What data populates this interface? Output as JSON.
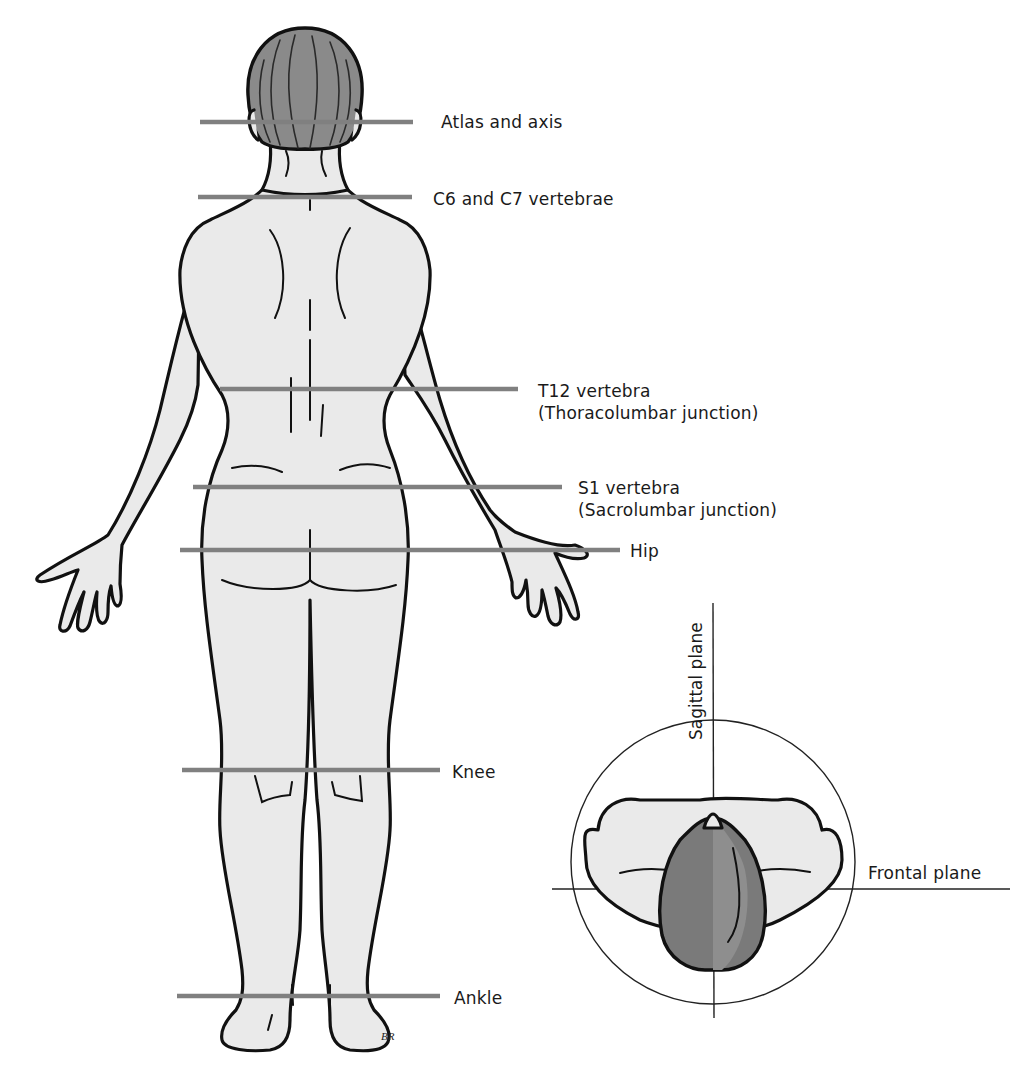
{
  "diagram": {
    "type": "anatomical-illustration",
    "colors": {
      "background": "#ffffff",
      "outline": "#111111",
      "skin": "#eaeaea",
      "hair": "#8a8a8a",
      "reference_line": "#808080",
      "plane_line": "#222222"
    },
    "reference_levels": [
      {
        "id": "atlas-axis",
        "lines": [
          "Atlas and axis"
        ],
        "y": 122
      },
      {
        "id": "c6-c7",
        "lines": [
          "C6 and C7 vertebrae"
        ],
        "y": 197
      },
      {
        "id": "t12",
        "lines": [
          "T12 vertebra",
          "(Thoracolumbar junction)"
        ],
        "y": 389
      },
      {
        "id": "s1",
        "lines": [
          "S1 vertebra",
          "(Sacrolumbar junction)"
        ],
        "y": 487
      },
      {
        "id": "hip",
        "lines": [
          "Hip"
        ],
        "y": 550
      },
      {
        "id": "knee",
        "lines": [
          "Knee"
        ],
        "y": 770
      },
      {
        "id": "ankle",
        "lines": [
          "Ankle"
        ],
        "y": 996
      }
    ],
    "plane_inset": {
      "sagittal_label": "Sagittal plane",
      "frontal_label": "Frontal plane"
    },
    "artist_initials": "BR"
  }
}
